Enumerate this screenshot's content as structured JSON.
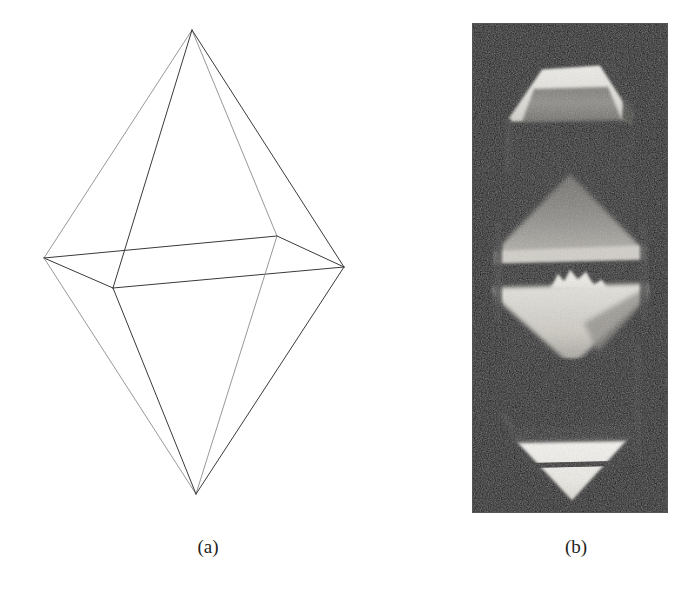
{
  "figure": {
    "background_color": "#ffffff",
    "panels": [
      {
        "id": "a",
        "caption": "(a)",
        "kind": "line-drawing",
        "description": "wireframe bipyramid crystal habit"
      },
      {
        "id": "b",
        "caption": "(b)",
        "kind": "photograph",
        "description": "grayscale photograph of bipyramidal crystal"
      }
    ]
  },
  "captions": {
    "a": "(a)",
    "b": "(b)"
  },
  "colors": {
    "page_background": "#ffffff",
    "line_stroke": "#3a3a3a",
    "line_stroke_light": "#8c8c8c",
    "caption_text": "#231f20",
    "photo_dark": "#0b0b0b",
    "photo_mid": "#6f6f6f",
    "photo_light": "#d8d8d8",
    "photo_bright": "#f2f2f2",
    "photo_border": "#1a1a1a"
  },
  "wireframe": {
    "stroke_width": 1.0,
    "viewbox": "0 0 400 520",
    "vertices": {
      "top_apex": {
        "label": "top apex",
        "x": 192,
        "y": 30
      },
      "bottom_apex": {
        "label": "bottom apex",
        "x": 196,
        "y": 494
      },
      "left": {
        "label": "left equator",
        "x": 44,
        "y": 258
      },
      "right": {
        "label": "right equator",
        "x": 344,
        "y": 267
      },
      "back": {
        "label": "back equator",
        "x": 277,
        "y": 236
      },
      "front": {
        "label": "front equator",
        "x": 113,
        "y": 288
      }
    },
    "edges": [
      {
        "name": "apex-left",
        "from": "top_apex",
        "to": "left",
        "weight": "light"
      },
      {
        "name": "apex-back",
        "from": "top_apex",
        "to": "back",
        "weight": "light"
      },
      {
        "name": "apex-right",
        "from": "top_apex",
        "to": "right",
        "weight": "dark"
      },
      {
        "name": "apex-front",
        "from": "top_apex",
        "to": "front",
        "weight": "dark"
      },
      {
        "name": "equator-left-back",
        "from": "left",
        "to": "back",
        "weight": "dark"
      },
      {
        "name": "equator-back-right",
        "from": "back",
        "to": "right",
        "weight": "dark"
      },
      {
        "name": "equator-right-front",
        "from": "right",
        "to": "front",
        "weight": "dark"
      },
      {
        "name": "equator-front-left",
        "from": "front",
        "to": "left",
        "weight": "dark"
      },
      {
        "name": "base-left",
        "from": "bottom_apex",
        "to": "left",
        "weight": "light"
      },
      {
        "name": "base-back",
        "from": "bottom_apex",
        "to": "back",
        "weight": "light"
      },
      {
        "name": "base-right",
        "from": "bottom_apex",
        "to": "right",
        "weight": "dark"
      },
      {
        "name": "base-front",
        "from": "bottom_apex",
        "to": "front",
        "weight": "dark"
      }
    ]
  },
  "photo": {
    "frame": {
      "x": 72,
      "y": 23,
      "width": 196,
      "height": 490
    },
    "regions": [
      {
        "name": "top-cap",
        "tone": "bright",
        "shape": "truncated-pyramid"
      },
      {
        "name": "top-cap-facet",
        "tone": "mid",
        "shape": "trapezoid"
      },
      {
        "name": "upper-dark-band",
        "tone": "dark",
        "shape": "band"
      },
      {
        "name": "mid-rhombus",
        "tone": "light",
        "shape": "rhombus"
      },
      {
        "name": "mid-dark-stripe",
        "tone": "dark",
        "shape": "stripe"
      },
      {
        "name": "mid-highlight",
        "tone": "bright",
        "shape": "wedge"
      },
      {
        "name": "lower-dark-band",
        "tone": "dark",
        "shape": "band"
      },
      {
        "name": "bottom-tip",
        "tone": "bright",
        "shape": "inverted-triangle"
      }
    ]
  }
}
